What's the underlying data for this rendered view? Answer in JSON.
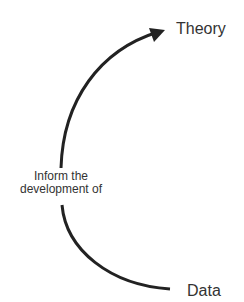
{
  "diagram": {
    "nodes": [
      {
        "id": "theory",
        "label": "Theory"
      },
      {
        "id": "data",
        "label": "Data"
      }
    ],
    "edges": [
      {
        "from": "data",
        "to": "theory",
        "label_line1": "Inform the",
        "label_line2": "development of",
        "arrow": "end"
      }
    ],
    "colors": {
      "stroke": "#222222",
      "text": "#333333",
      "background": "#ffffff"
    }
  }
}
